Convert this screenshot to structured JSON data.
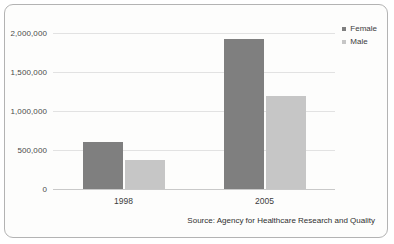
{
  "chart_data": {
    "type": "bar",
    "title": "",
    "xlabel": "",
    "ylabel": "",
    "categories": [
      "1998",
      "2005"
    ],
    "series": [
      {
        "name": "Female",
        "color": "#7f7f7f",
        "values": [
          603000,
          1923000
        ]
      },
      {
        "name": "Male",
        "color": "#c6c6c6",
        "values": [
          372000,
          1192000
        ]
      }
    ],
    "ylim": [
      0,
      2000000
    ],
    "yticks": [
      0,
      500000,
      1000000,
      1500000,
      2000000
    ],
    "ytick_labels": [
      "0",
      "500,000",
      "1,000,000",
      "1,500,000",
      "2,000,000"
    ],
    "grid": true,
    "legend_position": "top-right",
    "annotations": [
      "Source: Agency for Healthcare Research and Quality"
    ]
  },
  "legend": {
    "items": [
      {
        "label": "Female",
        "color": "#7f7f7f"
      },
      {
        "label": "Male",
        "color": "#c6c6c6"
      }
    ]
  },
  "source": {
    "text": "Source: Agency for Healthcare Research and Quality"
  }
}
